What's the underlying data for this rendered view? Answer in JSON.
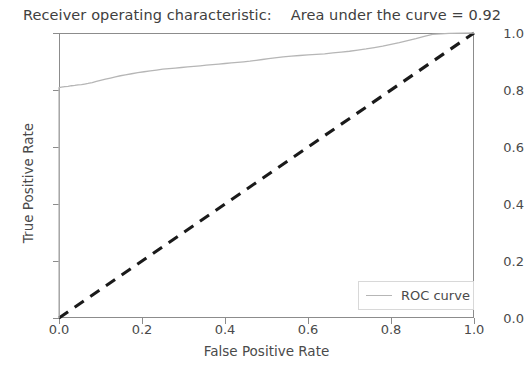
{
  "chart_data": {
    "type": "line",
    "title": "Receiver operating characteristic:    Area under the curve = 0.92",
    "title_parts": {
      "main": "Receiver operating characteristic:",
      "auc_text": "Area under the curve = 0.92",
      "auc_value": 0.92
    },
    "xlabel": "False Positive Rate",
    "ylabel": "True Positive Rate",
    "xlim": [
      0.0,
      1.0
    ],
    "ylim": [
      0.0,
      1.0
    ],
    "xticks": [
      "0.0",
      "0.2",
      "0.4",
      "0.6",
      "0.8",
      "1.0"
    ],
    "xtick_values": [
      0.0,
      0.2,
      0.4,
      0.6,
      0.8,
      1.0
    ],
    "yticks": [
      "0.0",
      "0.2",
      "0.4",
      "0.6",
      "0.8",
      "1.0"
    ],
    "ytick_values": [
      0.0,
      0.2,
      0.4,
      0.6,
      0.8,
      1.0
    ],
    "grid": false,
    "legend_position": "lower right",
    "legend_entries": [
      "ROC curve"
    ],
    "colors": {
      "roc_curve": "#b6b6b6",
      "chance_line": "#1a1a1a",
      "axis": "#8c8c8c",
      "text": "#4a4a4a",
      "background": "#ffffff"
    },
    "series": [
      {
        "name": "ROC curve",
        "style": "solid",
        "color": "#b6b6b6",
        "linewidth": 1.2,
        "x": [
          0.0,
          0.0,
          0.006,
          0.014,
          0.022,
          0.03,
          0.038,
          0.046,
          0.054,
          0.062,
          0.07,
          0.08,
          0.09,
          0.1,
          0.112,
          0.124,
          0.136,
          0.148,
          0.16,
          0.175,
          0.19,
          0.205,
          0.22,
          0.235,
          0.25,
          0.265,
          0.28,
          0.295,
          0.31,
          0.325,
          0.34,
          0.355,
          0.37,
          0.385,
          0.4,
          0.415,
          0.43,
          0.445,
          0.46,
          0.475,
          0.49,
          0.505,
          0.52,
          0.54,
          0.56,
          0.58,
          0.6,
          0.62,
          0.64,
          0.66,
          0.68,
          0.7,
          0.72,
          0.74,
          0.76,
          0.78,
          0.8,
          0.82,
          0.84,
          0.86,
          0.88,
          0.9,
          0.94,
          1.0
        ],
        "y": [
          0.0,
          0.808,
          0.81,
          0.812,
          0.813,
          0.815,
          0.816,
          0.818,
          0.819,
          0.821,
          0.823,
          0.826,
          0.83,
          0.834,
          0.838,
          0.842,
          0.846,
          0.85,
          0.853,
          0.857,
          0.861,
          0.864,
          0.867,
          0.87,
          0.873,
          0.875,
          0.877,
          0.879,
          0.881,
          0.883,
          0.885,
          0.887,
          0.889,
          0.891,
          0.893,
          0.895,
          0.897,
          0.899,
          0.901,
          0.904,
          0.907,
          0.91,
          0.913,
          0.916,
          0.919,
          0.921,
          0.923,
          0.925,
          0.927,
          0.93,
          0.933,
          0.936,
          0.94,
          0.944,
          0.949,
          0.954,
          0.96,
          0.966,
          0.973,
          0.98,
          0.988,
          0.995,
          0.999,
          1.0
        ]
      },
      {
        "name": "chance",
        "style": "dashed",
        "color": "#1a1a1a",
        "linewidth": 3.0,
        "x": [
          0.0,
          1.0
        ],
        "y": [
          0.0,
          1.0
        ]
      }
    ]
  },
  "legend": {
    "items": [
      {
        "label": "ROC curve",
        "color": "#b6b6b6"
      }
    ]
  }
}
